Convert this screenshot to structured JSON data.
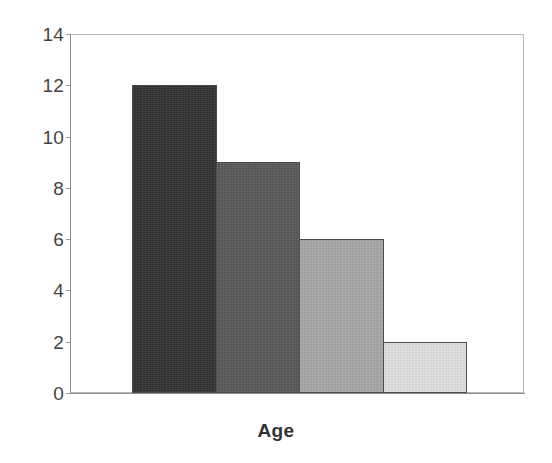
{
  "chart_data": {
    "type": "bar",
    "title": "",
    "subtitle": "",
    "xlabel": "Age",
    "ylabel": "",
    "categories": [
      "1",
      "2",
      "3",
      "4"
    ],
    "values": [
      12,
      9,
      6,
      2
    ],
    "series": [
      {
        "name": "Age",
        "values": [
          12,
          9,
          6,
          2
        ]
      }
    ],
    "ylim": [
      0,
      14
    ],
    "yticks": [
      0,
      2,
      4,
      6,
      8,
      10,
      12,
      14
    ],
    "ytick_labels": [
      "0",
      "2",
      "4",
      "6",
      "8",
      "10",
      "12",
      "14"
    ],
    "xtick_labels": [],
    "grid": false,
    "legend": false,
    "legend_position": "none",
    "bar_colors": [
      "#333333",
      "#5a5a5a",
      "#a8a8a8",
      "#e2e2e2"
    ],
    "bar_edge_color": "#4a4a4a",
    "frame_color": "#b9b9b9",
    "axis_color": "#8d8d8d",
    "label_color": "#444444",
    "background_color": "#ffffff"
  },
  "axis": {
    "y_title": "",
    "x_title": "Age"
  }
}
